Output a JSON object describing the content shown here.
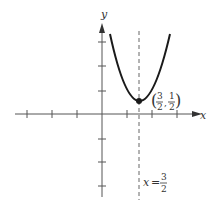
{
  "diagram": {
    "type": "parabola-graph",
    "axes": {
      "x_label": "x",
      "y_label": "y",
      "x_ticks": [
        -4,
        -3,
        -2,
        -1,
        1,
        2,
        3
      ],
      "y_ticks": [
        -4,
        -3,
        -2,
        1,
        2,
        3
      ]
    },
    "curve": {
      "type": "parabola",
      "vertex": [
        1.5,
        0.5
      ],
      "opens": "up"
    },
    "vertex_label": {
      "open": "(",
      "x_num": "3",
      "x_den": "2",
      "sep": ",",
      "y_num": "1",
      "y_den": "2",
      "close": ")"
    },
    "axis_of_symmetry": {
      "lhs": "x",
      "eq": "=",
      "num": "3",
      "den": "2"
    },
    "colors": {
      "curve": "#1a1a1a",
      "axis": "#555555",
      "dashed": "#666666"
    }
  }
}
